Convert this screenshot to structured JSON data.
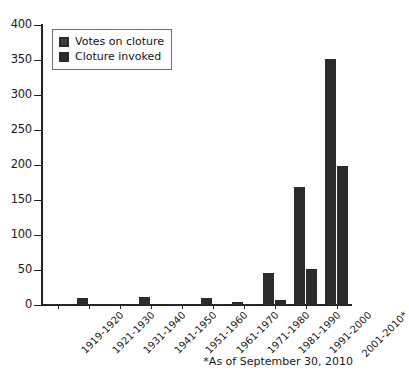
{
  "chart_data": {
    "type": "bar",
    "title": "",
    "subtitle": "",
    "xlabel": "",
    "ylabel": "",
    "ylim": [
      0,
      400
    ],
    "yticks": [
      0,
      50,
      100,
      150,
      200,
      250,
      300,
      350,
      400
    ],
    "grid": false,
    "legend_position": "top-left",
    "categories": [
      "1919-1920",
      "1921-1930",
      "1931-1940",
      "1941-1950",
      "1951-1960",
      "1961-1970",
      "1971-1980",
      "1981-1990",
      "1991-2000",
      "2001-2010*"
    ],
    "series": [
      {
        "name": "Votes on cloture",
        "color": "#2b2b2b",
        "values": [
          2,
          10,
          2,
          11,
          2,
          10,
          5,
          46,
          168,
          352
        ]
      },
      {
        "name": "Cloture invoked",
        "color": "#2b2b2b",
        "values": [
          1,
          2,
          0,
          0,
          0,
          1,
          1,
          7,
          51,
          198
        ]
      }
    ],
    "annotations": [
      "*As of September 30, 2010"
    ]
  },
  "legend": {
    "items": [
      {
        "label": "Votes on cloture"
      },
      {
        "label": "Cloture invoked"
      }
    ]
  },
  "footnote": {
    "text": "*As of September 30, 2010"
  },
  "colors": {
    "bar": "#2b2b2b",
    "axis": "#222222",
    "background": "#ffffff",
    "text": "#1a1a1a"
  }
}
